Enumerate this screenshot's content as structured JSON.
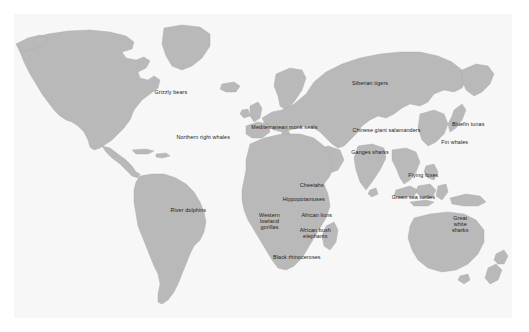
{
  "figure": {
    "type": "world-map",
    "background_color": "#ffffff",
    "panel_color": "#f7f7f7",
    "land_color": "#b9b9b9",
    "land_border_color": "#aaaaaa",
    "label_color": "#1b1b1b",
    "projection": "equirectangular"
  },
  "labels": [
    {
      "id": "grizzly-bears",
      "text": "Grizzly bears",
      "x": 31.5,
      "y": 25.5
    },
    {
      "id": "northern-right-whales",
      "text": "Northern right whales",
      "x": 38.0,
      "y": 40.5
    },
    {
      "id": "river-dolphins",
      "text": "River dolphins",
      "x": 35.0,
      "y": 64.5
    },
    {
      "id": "mediterranean-monk-seals",
      "text": "Mediterranean monk seals",
      "x": 54.3,
      "y": 37.2
    },
    {
      "id": "siberian-tigers",
      "text": "Siberian tigers",
      "x": 71.5,
      "y": 22.7
    },
    {
      "id": "chinese-giant-salamanders",
      "text": "Chinese giant salamanders",
      "x": 74.8,
      "y": 38.0
    },
    {
      "id": "ganges-sharks",
      "text": "Ganges sharks",
      "x": 71.5,
      "y": 45.3
    },
    {
      "id": "bluefin-tunas",
      "text": "Bluefin tunas",
      "x": 91.2,
      "y": 36.3
    },
    {
      "id": "fin-whales",
      "text": "Fin whales",
      "x": 88.5,
      "y": 42.0
    },
    {
      "id": "flying-foxes",
      "text": "Flying foxes",
      "x": 82.2,
      "y": 52.8
    },
    {
      "id": "green-sea-turtles",
      "text": "Green sea turtles",
      "x": 80.2,
      "y": 60.1
    },
    {
      "id": "great-white-sharks",
      "text": "Great\nwhite\nsharks",
      "x": 89.6,
      "y": 69.3
    },
    {
      "id": "cheetahs",
      "text": "Cheetahs",
      "x": 59.8,
      "y": 56.1
    },
    {
      "id": "hippopotamuses",
      "text": "Hippopotamuses",
      "x": 58.2,
      "y": 60.9
    },
    {
      "id": "western-lowland-gorillas",
      "text": "Western\nlowland\ngorillas",
      "x": 51.3,
      "y": 68.3
    },
    {
      "id": "african-lions",
      "text": "African lions",
      "x": 60.8,
      "y": 66.0
    },
    {
      "id": "african-bush-elephants",
      "text": "African bush\nelephants",
      "x": 60.5,
      "y": 72.0
    },
    {
      "id": "black-rhinoceroses",
      "text": "Black rhinoceroses",
      "x": 56.8,
      "y": 79.8
    }
  ]
}
